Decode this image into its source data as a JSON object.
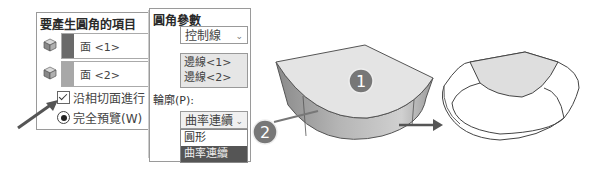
{
  "fillet_items_panel": {
    "title": "要產生圓角的項目",
    "faces": [
      {
        "label": "面 <1>",
        "color": "#6a6a6a"
      },
      {
        "label": "面 <2>",
        "color": "#a8a8a8"
      }
    ],
    "tangent_propagation": {
      "label": "沿相切面進行",
      "checked": true
    },
    "full_preview": {
      "label": "完全預覽(W)",
      "selected": true
    }
  },
  "fillet_params_panel": {
    "title": "圓角參數",
    "method_select": {
      "value": "控制線"
    },
    "edge_list": [
      "邊線<1>",
      "邊線<2>"
    ],
    "profile_label": "輪廓(P):",
    "profile_select": {
      "value": "曲率連續"
    },
    "profile_options": [
      {
        "label": "圓形",
        "selected": false
      },
      {
        "label": "曲率連續",
        "selected": true
      }
    ]
  },
  "callouts": [
    {
      "number": "1"
    },
    {
      "number": "2"
    }
  ]
}
